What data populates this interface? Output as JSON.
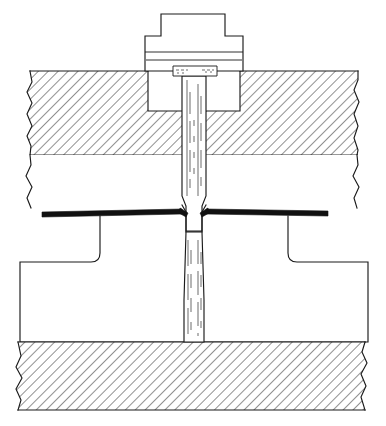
{
  "figure": {
    "type": "engineering-section-drawing",
    "background_color": "#ffffff",
    "line_color": "#1a1a1a",
    "hatch_color": "#2b2b2b",
    "thick_line_color": "#111111",
    "width": 386,
    "height": 426,
    "caption": ""
  },
  "components": {
    "bolt_head_top": {
      "name": "bolt-head-top-boss",
      "x": 161,
      "y": 14,
      "width": 64,
      "height": 22
    },
    "bolt_head_flange": {
      "name": "bolt-head-flange",
      "x": 145,
      "y": 36,
      "width": 98,
      "height": 35
    },
    "bolt_head_seat_line": {
      "name": "bolt-head-seat-line",
      "y": 60
    },
    "collar": {
      "name": "shank-collar-washer",
      "x": 173,
      "y": 66,
      "width": 44,
      "height": 10
    },
    "upper_slab": {
      "name": "upper-hatched-slab",
      "y_top": 71,
      "y_bottom": 155,
      "x_left": 30,
      "x_right": 358,
      "hatch_angle": 45,
      "hatch_spacing": 7
    },
    "counterbore": {
      "name": "counterbore-pocket",
      "x": 148,
      "y": 71,
      "width": 92,
      "height": 40
    },
    "white_band": {
      "name": "unhatched-middle-band",
      "y_top": 155,
      "y_bottom": 209,
      "x_left": 30,
      "x_right": 358
    },
    "plate_bar": {
      "name": "thick-plate-line",
      "x_left": 42,
      "x_right": 328,
      "y": 209,
      "thickness": 5
    },
    "shank_upper": {
      "name": "bolt-shank-upper",
      "x_left": 182,
      "x_right": 206,
      "y_top": 76,
      "y_bottom": 205
    },
    "shank_waist": {
      "name": "bolt-shank-waist",
      "x_left": 186,
      "x_right": 202,
      "y_top": 205,
      "y_bottom": 232
    },
    "shank_lower": {
      "name": "bolt-shank-lower",
      "x_left": 183,
      "x_right": 205,
      "y_top": 232,
      "y_bottom": 342
    },
    "lower_block": {
      "name": "lower-t-block",
      "stem_left": 100,
      "stem_right": 288,
      "stem_top": 216,
      "foot_left": 20,
      "foot_right": 368,
      "foot_top": 262,
      "bottom": 342,
      "corner_radius": 9
    },
    "bottom_slab": {
      "name": "bottom-hatched-slab",
      "y_top": 342,
      "y_bottom": 410,
      "x_left": 18,
      "x_right": 365,
      "hatch_angle": 45,
      "hatch_spacing": 7
    }
  },
  "labels": {
    "none_visible": ""
  }
}
